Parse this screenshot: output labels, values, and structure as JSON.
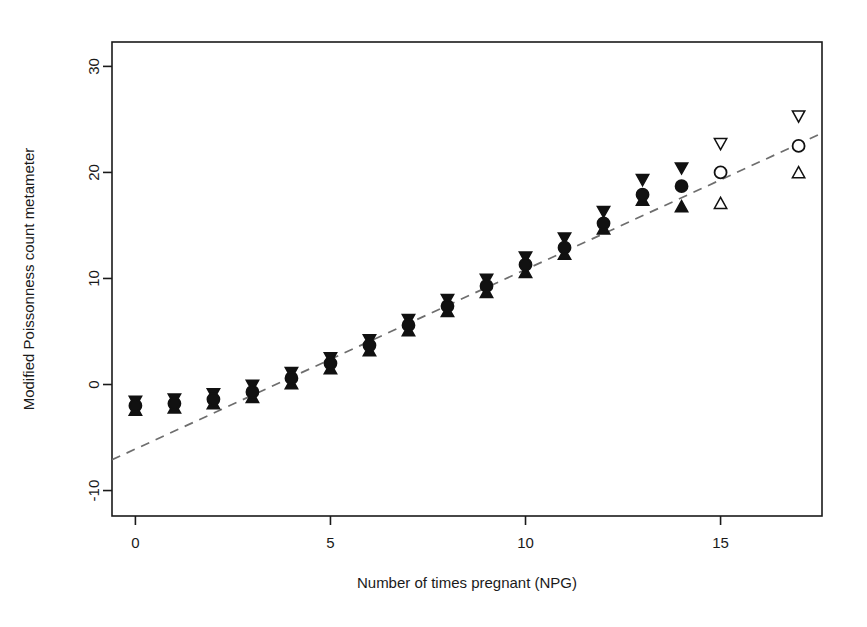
{
  "figure": {
    "background": "#ffffff",
    "foreground": "#1a1a1a",
    "line_color": "#6e6e6e",
    "marker_color": "#111111"
  },
  "chart_data": {
    "type": "scatter",
    "title": "",
    "subtitle": "",
    "xlabel": "Number of times pregnant (NPG)",
    "ylabel": "Modified Poissonness count metameter",
    "xlim": [
      -0.6,
      17.6
    ],
    "ylim": [
      -12.4,
      32.3
    ],
    "xticks": [
      0,
      5,
      10,
      15
    ],
    "xtick_labels": [
      "0",
      "5",
      "10",
      "15"
    ],
    "yticks": [
      -10,
      0,
      10,
      20,
      30
    ],
    "ytick_labels": [
      "-10",
      "0",
      "10",
      "20",
      "30"
    ],
    "grid": false,
    "legend": "none",
    "x": [
      0,
      1,
      2,
      3,
      4,
      5,
      6,
      7,
      8,
      9,
      10,
      11,
      12,
      13,
      14,
      15,
      17
    ],
    "series": [
      {
        "name": "Modified count metameter",
        "marker": "filled-circle",
        "values": [
          -2.0,
          -1.8,
          -1.4,
          -0.7,
          0.6,
          2.0,
          3.7,
          5.6,
          7.4,
          9.3,
          11.3,
          12.9,
          15.2,
          17.9,
          18.7,
          20.0,
          22.5
        ],
        "open_from_index": 15
      },
      {
        "name": "Upper confidence bound",
        "marker": "down-triangle",
        "values": [
          -1.6,
          -1.4,
          -0.9,
          -0.1,
          1.1,
          2.5,
          4.2,
          6.1,
          8.0,
          9.9,
          12.0,
          13.8,
          16.3,
          19.3,
          20.4,
          22.7,
          25.3
        ]
      },
      {
        "name": "Lower confidence bound",
        "marker": "up-triangle",
        "values": [
          -2.4,
          -2.2,
          -1.8,
          -1.2,
          0.1,
          1.5,
          3.2,
          5.1,
          6.9,
          8.7,
          10.6,
          12.3,
          14.7,
          17.4,
          16.8,
          17.1,
          20.0
        ]
      }
    ],
    "reference_line": {
      "name": "fitted-poissonness-line",
      "style": "dashed",
      "x1": -0.6,
      "y1": -7.1,
      "x2": 17.6,
      "y2": 23.7
    }
  }
}
